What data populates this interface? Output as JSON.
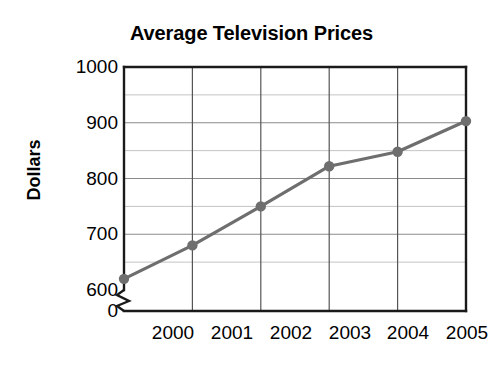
{
  "chart_data": {
    "type": "line",
    "title": "Average Television Prices",
    "xlabel": "",
    "ylabel": "Dollars",
    "categories": [
      "2000",
      "2001",
      "2002",
      "2003",
      "2004",
      "2005"
    ],
    "x": [
      2000,
      2001,
      2002,
      2003,
      2004,
      2005
    ],
    "values": [
      620,
      680,
      750,
      822,
      848,
      903
    ],
    "series": [
      {
        "name": "Average Television Prices",
        "values": [
          620,
          680,
          750,
          822,
          848,
          903
        ]
      }
    ],
    "ylim": [
      600,
      1000
    ],
    "y_tick_labels": [
      "1000",
      "900",
      "800",
      "700",
      "600",
      "0"
    ],
    "y_major_ticks": [
      600,
      700,
      800,
      900,
      1000
    ],
    "y_minor_interval": 50,
    "axis_break": true,
    "axis_break_label": "0",
    "grid": "both",
    "legend": "none",
    "line_color": "#6e6e6e",
    "marker_color": "#6e6e6e",
    "axis_color": "#1a1a1a",
    "gridline_color": "#8c8c8c",
    "minor_gridline_color": "#bdbdbd",
    "background_color": "#ffffff"
  },
  "axis": {
    "y_ticks": [
      {
        "label": "1000",
        "value": 1000
      },
      {
        "label": "900",
        "value": 900
      },
      {
        "label": "800",
        "value": 800
      },
      {
        "label": "700",
        "value": 700
      },
      {
        "label": "600",
        "value": 600
      },
      {
        "label": "0",
        "value": 0
      }
    ],
    "x_ticks": [
      {
        "label": "2000"
      },
      {
        "label": "2001"
      },
      {
        "label": "2002"
      },
      {
        "label": "2003"
      },
      {
        "label": "2004"
      },
      {
        "label": "2005"
      }
    ]
  }
}
